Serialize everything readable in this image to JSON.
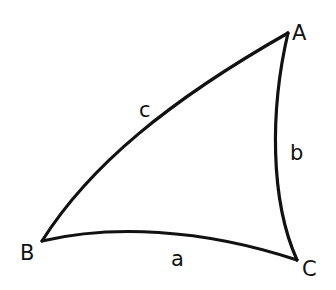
{
  "diagram": {
    "type": "spherical-triangle",
    "stroke_color": "#111111",
    "background": "#ffffff",
    "vertices": {
      "A": {
        "label": "A",
        "x": 288,
        "y": 33
      },
      "B": {
        "label": "B",
        "x": 42,
        "y": 241
      },
      "C": {
        "label": "C",
        "x": 297,
        "y": 260
      }
    },
    "sides": {
      "a": {
        "label": "a",
        "from": "B",
        "to": "C"
      },
      "b": {
        "label": "b",
        "from": "A",
        "to": "C"
      },
      "c": {
        "label": "c",
        "from": "B",
        "to": "A"
      }
    }
  }
}
